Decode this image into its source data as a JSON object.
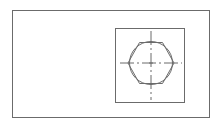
{
  "drawing": {
    "type": "technical-drawing",
    "subject": "hex nut top view",
    "line_color": "#6b6b6b",
    "background": "#ffffff",
    "elements": [
      "outer-frame",
      "view-box",
      "hexagon",
      "chamfer-circle",
      "center-mark",
      "centerline-horizontal",
      "centerline-vertical"
    ]
  }
}
